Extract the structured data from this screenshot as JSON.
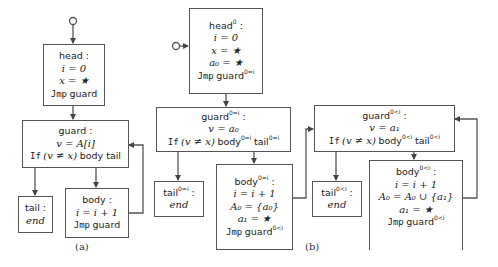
{
  "figure": {
    "captions": {
      "a": "(a)",
      "b": "(b)"
    },
    "colors": {
      "stroke": "#555555",
      "text": "#222222",
      "background": "#ffffff"
    }
  },
  "diagram_a": {
    "head": {
      "title": "head :",
      "lines": [
        "i = 0",
        "x = ★"
      ],
      "jmp": "Jmp",
      "jmp_target": "guard"
    },
    "guard": {
      "title": "guard :",
      "assign": "v = A[i]",
      "if_kw": "If",
      "cond": "(v ≠ x)",
      "targets": "body tail"
    },
    "tail": {
      "title": "tail :",
      "body": "end"
    },
    "body": {
      "title": "body :",
      "lines": [
        "i = i + 1"
      ],
      "jmp": "Jmp",
      "jmp_target": "guard"
    }
  },
  "diagram_b": {
    "head0": {
      "title": "head",
      "title_sup": "0",
      "colon": " :",
      "lines": [
        "i = 0",
        "x = ★",
        "a₀ = ★"
      ],
      "jmp": "Jmp",
      "jmp_target": "guard",
      "jmp_sup": "0=i"
    },
    "guard_eq": {
      "title": "guard",
      "title_sup": "0=i",
      "colon": " :",
      "assign": "v = a₀",
      "if_kw": "If",
      "cond": "(v ≠ x)",
      "t1": "body",
      "t1_sup": "0=i",
      "t2": "tail",
      "t2_sup": "0=i"
    },
    "tail_eq": {
      "title": "tail",
      "title_sup": "0=i",
      "colon": " :",
      "body": "end"
    },
    "body_eq": {
      "title": "body",
      "title_sup": "0=i",
      "colon": " :",
      "lines": [
        "i = i + 1",
        "A₀ = {a₀}",
        "a₁ = ★"
      ],
      "jmp": "Jmp",
      "jmp_target": "guard",
      "jmp_sup": "0<i"
    },
    "guard_lt": {
      "title": "guard",
      "title_sup": "0<i",
      "colon": " :",
      "assign": "v = a₁",
      "if_kw": "If",
      "cond": "(v ≠ x)",
      "t1": "body",
      "t1_sup": "0<i",
      "t2": "tail",
      "t2_sup": "0<i"
    },
    "tail_lt": {
      "title": "tail",
      "title_sup": "0<i",
      "colon": " :",
      "body": "end"
    },
    "body_lt": {
      "title": "body",
      "title_sup": "0<i",
      "colon": " :",
      "lines": [
        "i = i + 1",
        "A₀ = A₀ ∪ {a₁}",
        "a₁ = ★"
      ],
      "jmp": "Jmp",
      "jmp_target": "guard",
      "jmp_sup": "0<i"
    }
  }
}
